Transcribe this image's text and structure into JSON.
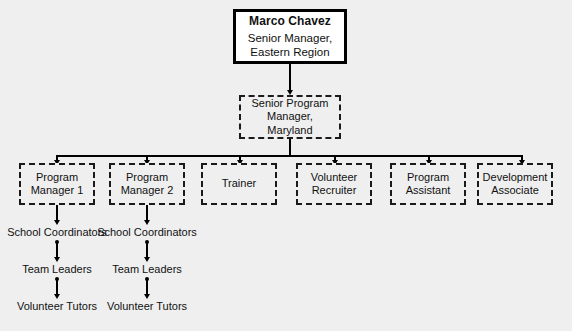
{
  "diagram": {
    "type": "organizational-chart",
    "background_color": "#efefef",
    "line_color": "#000000",
    "text_color": "#111111",
    "root": {
      "name": "Marco Chavez",
      "title": "Senior Manager,\nEastern Region",
      "border_style": "solid",
      "fill_color": "#ffffff"
    },
    "second_level": {
      "label": "Senior Program\nManager,\nMaryland",
      "border_style": "dashed",
      "fill_color": "#efefef"
    },
    "third_level": [
      {
        "label": "Program\nManager 1",
        "border_style": "dashed"
      },
      {
        "label": "Program\nManager 2",
        "border_style": "dashed"
      },
      {
        "label": "Trainer",
        "border_style": "dashed"
      },
      {
        "label": "Volunteer\nRecruiter",
        "border_style": "dashed"
      },
      {
        "label": "Program\nAssistant",
        "border_style": "dashed"
      },
      {
        "label": "Development\nAssociate",
        "border_style": "dashed"
      }
    ],
    "sub_chains": [
      {
        "parent": "Program Manager 1",
        "items": [
          "School Coordinators",
          "Team Leaders",
          "Volunteer Tutors"
        ]
      },
      {
        "parent": "Program Manager 2",
        "items": [
          "School Coordinators",
          "Team Leaders",
          "Volunteer Tutors"
        ]
      }
    ]
  }
}
